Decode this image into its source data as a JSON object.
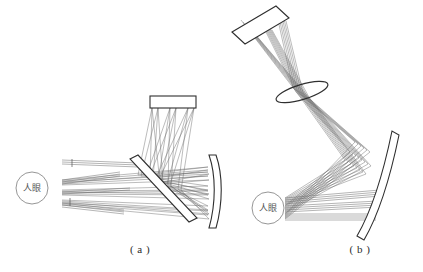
{
  "figure": {
    "background_color": "#ffffff",
    "line_color": "#3a3a3a",
    "ray_color": "#5a5a5a",
    "width": 423,
    "height": 272
  },
  "panels": [
    {
      "id": "a",
      "caption": "( a )",
      "eye_label": "人眼",
      "components": [
        {
          "name": "display-panel",
          "type": "flat-rectangle",
          "orientation": "horizontal"
        },
        {
          "name": "beam-splitter",
          "type": "tilted-plate",
          "orientation": "diagonal"
        },
        {
          "name": "curved-mirror",
          "type": "curved-plate",
          "orientation": "vertical"
        }
      ],
      "ray_bundle_count": 3
    },
    {
      "id": "b",
      "caption": "( b )",
      "eye_label": "人眼",
      "components": [
        {
          "name": "display-panel",
          "type": "tilted-rectangle",
          "orientation": "diagonal"
        },
        {
          "name": "relay-lens",
          "type": "tilted-ellipse",
          "orientation": "diagonal"
        },
        {
          "name": "curved-mirror",
          "type": "curved-plate",
          "orientation": "tilted"
        }
      ],
      "ray_bundle_count": 3
    }
  ]
}
